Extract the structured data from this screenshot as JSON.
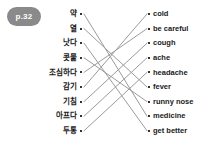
{
  "badge": {
    "label": "p.32"
  },
  "worksheet": {
    "type": "matching-exercise",
    "left_column": {
      "items": [
        {
          "id": "l1",
          "label": "약"
        },
        {
          "id": "l2",
          "label": "열"
        },
        {
          "id": "l3",
          "label": "낫다"
        },
        {
          "id": "l4",
          "label": "콧물"
        },
        {
          "id": "l5",
          "label": "조심하다"
        },
        {
          "id": "l6",
          "label": "감기"
        },
        {
          "id": "l7",
          "label": "기침"
        },
        {
          "id": "l8",
          "label": "아프다"
        },
        {
          "id": "l9",
          "label": "두통"
        }
      ]
    },
    "right_column": {
      "items": [
        {
          "id": "r1",
          "label": "cold"
        },
        {
          "id": "r2",
          "label": "be careful"
        },
        {
          "id": "r3",
          "label": "cough"
        },
        {
          "id": "r4",
          "label": "ache"
        },
        {
          "id": "r5",
          "label": "headache"
        },
        {
          "id": "r6",
          "label": "fever"
        },
        {
          "id": "r7",
          "label": "runny nose"
        },
        {
          "id": "r8",
          "label": "medicine"
        },
        {
          "id": "r9",
          "label": "get better"
        }
      ]
    },
    "connections": [
      {
        "from": "l1",
        "to": "r8"
      },
      {
        "from": "l2",
        "to": "r6"
      },
      {
        "from": "l3",
        "to": "r9"
      },
      {
        "from": "l4",
        "to": "r7"
      },
      {
        "from": "l5",
        "to": "r2"
      },
      {
        "from": "l6",
        "to": "r1"
      },
      {
        "from": "l7",
        "to": "r3"
      },
      {
        "from": "l8",
        "to": "r4"
      },
      {
        "from": "l9",
        "to": "r5"
      }
    ],
    "colors": {
      "background": "#ffffff",
      "text": "#1a1a1a",
      "line": "#9b9b9b",
      "dot": "#333333",
      "badge_background": "#8a8a8a",
      "badge_text": "#ffffff"
    },
    "geometry": {
      "left_dot_x": 82,
      "right_dot_x": 148,
      "first_row_y": 14,
      "row_spacing": 14.6
    }
  }
}
